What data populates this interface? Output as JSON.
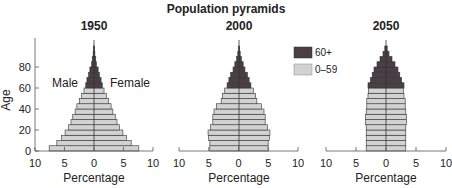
{
  "chart_data": {
    "type": "bar",
    "subtype": "population-pyramid",
    "title": "Population pyramids",
    "xlabel": "Percentage",
    "ylabel": "Age",
    "xlim": [
      -10,
      10
    ],
    "ylim": [
      0,
      100
    ],
    "x_ticks": [
      "10",
      "5",
      "0",
      "5",
      "10"
    ],
    "y_ticks": [
      "0",
      "20",
      "40",
      "60",
      "80"
    ],
    "side_labels": {
      "left": "Male",
      "right": "Female"
    },
    "legend": [
      {
        "label": "60+",
        "color": "#4a3f44"
      },
      {
        "label": "0–59",
        "color": "#d2d2d2"
      }
    ],
    "categories": [
      "0-4",
      "5-9",
      "10-14",
      "15-19",
      "20-24",
      "25-29",
      "30-34",
      "35-39",
      "40-44",
      "45-49",
      "50-54",
      "55-59",
      "60-64",
      "65-69",
      "70-74",
      "75-79",
      "80-84",
      "85-89",
      "90-94",
      "95-99"
    ],
    "panels": [
      {
        "name": "1950",
        "values": [
          7.6,
          6.3,
          5.5,
          4.9,
          4.3,
          3.9,
          3.6,
          3.2,
          2.9,
          2.5,
          2.1,
          1.7,
          1.4,
          1.2,
          0.9,
          0.7,
          0.4,
          0.3,
          0.15,
          0.1
        ]
      },
      {
        "name": "2000",
        "values": [
          4.9,
          4.9,
          5.1,
          5.2,
          4.8,
          4.4,
          4.4,
          4.2,
          3.8,
          3.0,
          2.8,
          2.4,
          2.0,
          1.7,
          1.4,
          1.0,
          0.7,
          0.4,
          0.2,
          0.1
        ]
      },
      {
        "name": "2050",
        "values": [
          3.3,
          3.3,
          3.3,
          3.3,
          3.3,
          3.4,
          3.4,
          3.3,
          3.2,
          3.2,
          3.0,
          2.9,
          3.0,
          2.6,
          2.3,
          2.0,
          1.5,
          1.0,
          0.5,
          0.2
        ]
      }
    ],
    "grid": false,
    "legend_position": "between panel 2000 and 2050, upper"
  }
}
